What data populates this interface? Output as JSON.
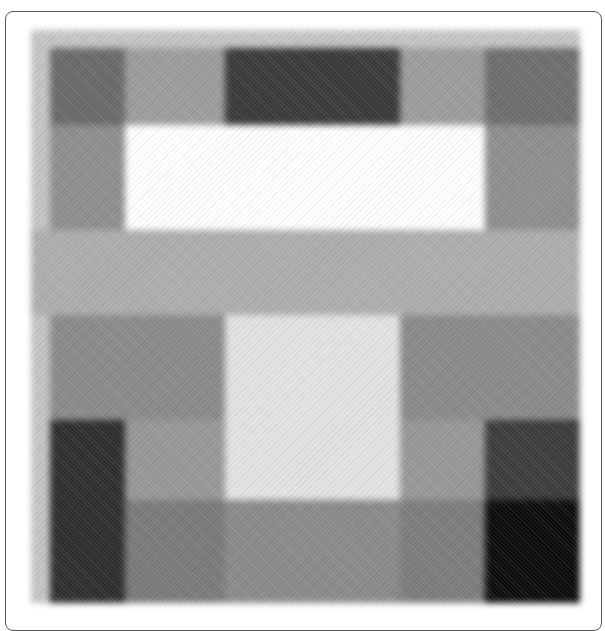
{
  "image": {
    "description": "Blurred grayscale image of rectangular tonal blocks arranged in a grid inside a rounded frame",
    "canvas_background": "#c4c4c4",
    "blocks": [
      {
        "name": "top-left-dark",
        "x": 19,
        "y": 18,
        "w": 75,
        "h": 77,
        "color": "#6a6a6a"
      },
      {
        "name": "top-left-mid",
        "x": 94,
        "y": 18,
        "w": 100,
        "h": 77,
        "color": "#9c9c9c"
      },
      {
        "name": "top-center-dark",
        "x": 194,
        "y": 18,
        "w": 175,
        "h": 77,
        "color": "#3a3a3a"
      },
      {
        "name": "top-right-mid",
        "x": 369,
        "y": 18,
        "w": 85,
        "h": 77,
        "color": "#9c9c9c"
      },
      {
        "name": "top-right-dark",
        "x": 454,
        "y": 18,
        "w": 95,
        "h": 77,
        "color": "#6e6e6e"
      },
      {
        "name": "upper-left-gray",
        "x": 19,
        "y": 95,
        "w": 75,
        "h": 105,
        "color": "#8e8e8e"
      },
      {
        "name": "upper-center-white",
        "x": 94,
        "y": 95,
        "w": 360,
        "h": 105,
        "color": "#fefefe"
      },
      {
        "name": "upper-right-gray",
        "x": 454,
        "y": 95,
        "w": 95,
        "h": 105,
        "color": "#8e8e8e"
      },
      {
        "name": "middle-band-light",
        "x": 0,
        "y": 200,
        "w": 549,
        "h": 85,
        "color": "#adadad"
      },
      {
        "name": "lower-left-gray",
        "x": 19,
        "y": 285,
        "w": 175,
        "h": 105,
        "color": "#8a8a8a"
      },
      {
        "name": "lower-center-light",
        "x": 194,
        "y": 285,
        "w": 175,
        "h": 185,
        "color": "#e2e2e2"
      },
      {
        "name": "lower-right-gray",
        "x": 369,
        "y": 285,
        "w": 180,
        "h": 105,
        "color": "#8a8a8a"
      },
      {
        "name": "bottom-left-black",
        "x": 19,
        "y": 390,
        "w": 75,
        "h": 183,
        "color": "#2e2e2e"
      },
      {
        "name": "bottom-left-mid",
        "x": 94,
        "y": 390,
        "w": 100,
        "h": 80,
        "color": "#979797"
      },
      {
        "name": "bottom-right-mid",
        "x": 369,
        "y": 390,
        "w": 85,
        "h": 80,
        "color": "#979797"
      },
      {
        "name": "bottom-right-dark",
        "x": 454,
        "y": 390,
        "w": 95,
        "h": 80,
        "color": "#3c3c3c"
      },
      {
        "name": "base-left-gray",
        "x": 94,
        "y": 470,
        "w": 100,
        "h": 103,
        "color": "#7a7a7a"
      },
      {
        "name": "base-center-gray",
        "x": 194,
        "y": 470,
        "w": 175,
        "h": 103,
        "color": "#8a8a8a"
      },
      {
        "name": "base-right-gray",
        "x": 369,
        "y": 470,
        "w": 85,
        "h": 103,
        "color": "#7c7c7c"
      },
      {
        "name": "base-right-black",
        "x": 454,
        "y": 470,
        "w": 95,
        "h": 103,
        "color": "#0c0c0c"
      }
    ]
  }
}
